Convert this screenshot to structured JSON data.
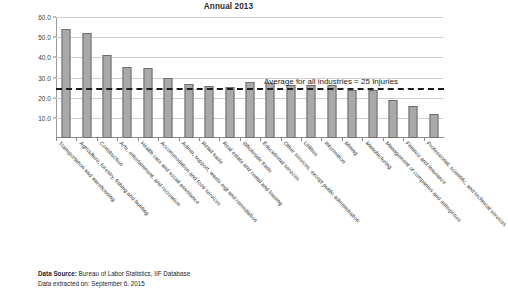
{
  "title": {
    "main_clipped": "Nonfatal Occupational Injuries and Illnesses by Industry Sector",
    "sub": "Annual 2013"
  },
  "footer": {
    "source_label": "Data Source:",
    "source_value": " Bureau of Labor Statistics, IIF Database",
    "extracted": "Data extracted on: September 6, 2015"
  },
  "annotation": {
    "average_text": "Average for all industries = 25 Injuries"
  },
  "colors": {
    "bar_fill": "#a9a9a9",
    "bar_stroke": "#6e6e6e",
    "gridline": "#cfcfcf",
    "average_line": "#1c1c1c"
  },
  "chart_data": {
    "type": "bar",
    "title": "Nonfatal Occupational Injuries and Illnesses by Industry Sector",
    "subtitle": "Annual 2013",
    "xlabel": "",
    "ylabel": "",
    "ylim": [
      0,
      60
    ],
    "yticks": [
      10.0,
      20.0,
      30.0,
      40.0,
      50.0,
      60.0
    ],
    "ytick_labels": [
      "10.0",
      "20.0",
      "30.0",
      "40.0",
      "50.0",
      "60.0"
    ],
    "grid": true,
    "legend": "none",
    "categories": [
      "Transportation and warehousing",
      "Agriculture, forestry, fishing and hunting",
      "Construction",
      "Arts, entertainment, and recreation",
      "Health care and social assistance",
      "Accommodation and food services",
      "Admin, support, waste mgt and remediation",
      "Retail trade",
      "Real estate and rental and leasing",
      "Wholesale trade",
      "Educational services",
      "Other services, except public administration",
      "Utilities",
      "Information",
      "Mining",
      "Manufacturing",
      "Management of companies and enterprises",
      "Finance and insurance",
      "Professional, scientific, and technical services"
    ],
    "values": [
      54.0,
      52.0,
      41.0,
      35.0,
      34.5,
      30.0,
      27.0,
      26.0,
      25.5,
      28.0,
      27.5,
      26.5,
      26.5,
      26.5,
      24.0,
      24.0,
      19.0,
      16.0,
      12.0
    ],
    "annotations": [
      {
        "type": "hline",
        "value": 25,
        "label": "Average for all industries = 25 Injuries",
        "style": "dashed"
      }
    ]
  }
}
